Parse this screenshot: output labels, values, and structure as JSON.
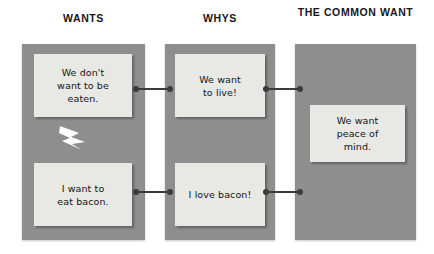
{
  "diagram": {
    "columns": [
      {
        "id": "wants",
        "header": "WANTS",
        "cards": [
          {
            "text": "We don't\nwant to be\neaten."
          },
          {
            "text": "I want to\neat bacon."
          }
        ]
      },
      {
        "id": "whys",
        "header": "WHYS",
        "cards": [
          {
            "text": "We want\nto live!"
          },
          {
            "text": "I love bacon!"
          }
        ]
      },
      {
        "id": "common",
        "header": "THE COMMON WANT",
        "cards": [
          {
            "text": "We want\npeace of\nmind."
          }
        ]
      }
    ],
    "connectors": [
      {
        "id": "top-1",
        "from": "wants-card-1",
        "to": "whys-card-1"
      },
      {
        "id": "top-2",
        "from": "whys-card-1",
        "to": "common-card-1"
      },
      {
        "id": "bottom-1",
        "from": "wants-card-2",
        "to": "whys-card-2"
      },
      {
        "id": "bottom-2",
        "from": "whys-card-2",
        "to": "common-card-1"
      }
    ],
    "conflict_marker": {
      "icon": "lightning-bolt-icon",
      "color": "#ffffff"
    },
    "colors": {
      "panel": "#8e8e8e",
      "card": "#e8e8e4",
      "connector": "#3a3a3f",
      "header_text": "#16161a",
      "card_text": "#14141a",
      "background": "#ffffff"
    }
  }
}
